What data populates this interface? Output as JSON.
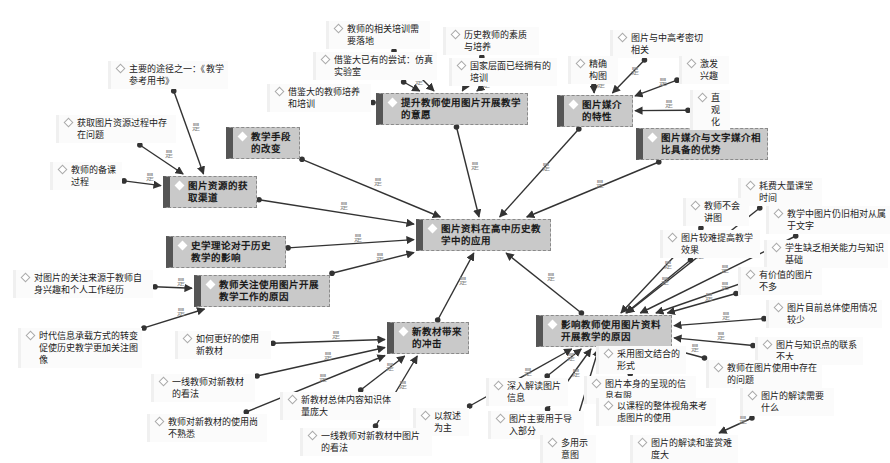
{
  "diagram": {
    "center": {
      "id": "c",
      "text": "图片资料在高中历史教学中的应用",
      "x": 416,
      "y": 219,
      "w": 135
    },
    "main_nodes": [
      {
        "id": "m1",
        "text": "提升教师使用图片开展教学的意愿",
        "x": 376,
        "y": 93,
        "w": 152
      },
      {
        "id": "m2",
        "text": "图片媒介的特性",
        "x": 557,
        "y": 95,
        "w": 76
      },
      {
        "id": "m3",
        "text": "图片媒介与文字媒介相比具备的优势",
        "x": 636,
        "y": 128,
        "w": 132
      },
      {
        "id": "m4",
        "text": "教学手段的改变",
        "x": 226,
        "y": 127,
        "w": 74
      },
      {
        "id": "m5",
        "text": "图片资源的获取渠道",
        "x": 163,
        "y": 176,
        "w": 94
      },
      {
        "id": "m6",
        "text": "史学理论对于历史教学的影响",
        "x": 166,
        "y": 236,
        "w": 120
      },
      {
        "id": "m7",
        "text": "教师关注使用图片开展教学工作的原因",
        "x": 194,
        "y": 275,
        "w": 136
      },
      {
        "id": "m8",
        "text": "新教材带来的冲击",
        "x": 387,
        "y": 322,
        "w": 82
      },
      {
        "id": "m9",
        "text": "影响教师使用图片资料开展教学的原因",
        "x": 536,
        "y": 315,
        "w": 136
      }
    ],
    "leaf_nodes": [
      {
        "id": "l1",
        "text": "主要的途径之一：《教学参考用书》",
        "x": 108,
        "y": 61,
        "w": 120
      },
      {
        "id": "l2",
        "text": "获取图片资源过程中存在问题",
        "x": 56,
        "y": 115,
        "w": 120
      },
      {
        "id": "l3",
        "text": "教师的备课过程",
        "x": 50,
        "y": 162,
        "w": 72
      },
      {
        "id": "l4",
        "text": "教师的相关培训需要落地",
        "x": 326,
        "y": 21,
        "w": 104
      },
      {
        "id": "l5",
        "text": "历史教师的素质与培养",
        "x": 443,
        "y": 27,
        "w": 96
      },
      {
        "id": "l6",
        "text": "借鉴大已有的尝试：仿真实验室",
        "x": 313,
        "y": 52,
        "w": 124
      },
      {
        "id": "l7",
        "text": "国家层面已经拥有的培训",
        "x": 449,
        "y": 58,
        "w": 108
      },
      {
        "id": "l8",
        "text": "借鉴大的教师培养和培训",
        "x": 267,
        "y": 84,
        "w": 104
      },
      {
        "id": "l9",
        "text": "图片与中高考密切相关",
        "x": 610,
        "y": 30,
        "w": 100
      },
      {
        "id": "l10",
        "text": "精确构图",
        "x": 568,
        "y": 56,
        "w": 50
      },
      {
        "id": "l11",
        "text": "激发兴趣",
        "x": 679,
        "y": 56,
        "w": 50
      },
      {
        "id": "l12",
        "text": "直观化",
        "x": 690,
        "y": 90,
        "w": 40
      },
      {
        "id": "l13",
        "text": "耗费大量课堂时间",
        "x": 738,
        "y": 178,
        "w": 84
      },
      {
        "id": "l14",
        "text": "教师不会讲图",
        "x": 683,
        "y": 198,
        "w": 66
      },
      {
        "id": "l15",
        "text": "教学中图片仍旧相对从属于文字",
        "x": 766,
        "y": 206,
        "w": 124
      },
      {
        "id": "l16",
        "text": "图片较难提高教学效果",
        "x": 660,
        "y": 230,
        "w": 100
      },
      {
        "id": "l17",
        "text": "学生缺乏相关能力与知识基础",
        "x": 764,
        "y": 240,
        "w": 124
      },
      {
        "id": "l18",
        "text": "有价值的图片不多",
        "x": 738,
        "y": 267,
        "w": 84
      },
      {
        "id": "l19",
        "text": "图片目前总体使用情况较少",
        "x": 766,
        "y": 300,
        "w": 116
      },
      {
        "id": "l20",
        "text": "图片与知识点的联系不大",
        "x": 755,
        "y": 337,
        "w": 108
      },
      {
        "id": "l21",
        "text": "教师在图片使用中存在的问题",
        "x": 706,
        "y": 360,
        "w": 116
      },
      {
        "id": "l22",
        "text": "图片的解读需要什么",
        "x": 740,
        "y": 388,
        "w": 94
      },
      {
        "id": "l23",
        "text": "图片的解读和鉴赏难度大",
        "x": 630,
        "y": 435,
        "w": 108
      },
      {
        "id": "l24",
        "text": "采用图文结合的形式",
        "x": 596,
        "y": 346,
        "w": 90
      },
      {
        "id": "l25",
        "text": "图片本身的呈现的信息有限",
        "x": 584,
        "y": 376,
        "w": 112
      },
      {
        "id": "l26",
        "text": "以课程的整体视角来考虑图片的使用",
        "x": 596,
        "y": 398,
        "w": 120
      },
      {
        "id": "l27",
        "text": "深入解读图片信息",
        "x": 486,
        "y": 378,
        "w": 82
      },
      {
        "id": "l28",
        "text": "图片主要用于导入部分",
        "x": 488,
        "y": 411,
        "w": 96
      },
      {
        "id": "l29",
        "text": "多用示意图",
        "x": 540,
        "y": 435,
        "w": 56
      },
      {
        "id": "l30",
        "text": "以叙述为主",
        "x": 413,
        "y": 408,
        "w": 56
      },
      {
        "id": "l31",
        "text": "如何更好的使用新教材",
        "x": 175,
        "y": 331,
        "w": 96
      },
      {
        "id": "l32",
        "text": "一线教师对新教材的看法",
        "x": 151,
        "y": 374,
        "w": 104
      },
      {
        "id": "l33",
        "text": "新教材总体内容知识体量庞大",
        "x": 280,
        "y": 392,
        "w": 120
      },
      {
        "id": "l34",
        "text": "教师对新教材的使用尚不熟悉",
        "x": 147,
        "y": 414,
        "w": 120
      },
      {
        "id": "l35",
        "text": "一线教师对新教材中图片的看法",
        "x": 300,
        "y": 428,
        "w": 132
      },
      {
        "id": "l36",
        "text": "对图片的关注来源于教师自身兴趣和个人工作经历",
        "x": 13,
        "y": 270,
        "w": 140
      },
      {
        "id": "l37",
        "text": "时代信息承载方式的转变促使历史教学更加关注图像",
        "x": 18,
        "y": 328,
        "w": 124
      }
    ],
    "edge_label": "是",
    "edges": [
      [
        "m1",
        "c"
      ],
      [
        "m2",
        "c"
      ],
      [
        "m3",
        "c"
      ],
      [
        "m4",
        "c"
      ],
      [
        "m5",
        "c"
      ],
      [
        "m6",
        "c"
      ],
      [
        "m7",
        "c"
      ],
      [
        "m8",
        "c"
      ],
      [
        "m9",
        "c"
      ],
      [
        "l1",
        "m5"
      ],
      [
        "l2",
        "m5"
      ],
      [
        "l3",
        "m5"
      ],
      [
        "l4",
        "m1"
      ],
      [
        "l5",
        "m1"
      ],
      [
        "l6",
        "m1"
      ],
      [
        "l7",
        "m1"
      ],
      [
        "l8",
        "m1"
      ],
      [
        "l9",
        "m2"
      ],
      [
        "l10",
        "m2"
      ],
      [
        "l11",
        "m2"
      ],
      [
        "l12",
        "m2"
      ],
      [
        "l13",
        "m9"
      ],
      [
        "l14",
        "m9"
      ],
      [
        "l15",
        "m9"
      ],
      [
        "l16",
        "m9"
      ],
      [
        "l17",
        "m9"
      ],
      [
        "l18",
        "m9"
      ],
      [
        "l19",
        "m9"
      ],
      [
        "l20",
        "m9"
      ],
      [
        "l21",
        "m9"
      ],
      [
        "l22",
        "l23"
      ],
      [
        "l24",
        "m9"
      ],
      [
        "l25",
        "m9"
      ],
      [
        "l27",
        "m9"
      ],
      [
        "l28",
        "m9"
      ],
      [
        "l29",
        "m9"
      ],
      [
        "l30",
        "m9"
      ],
      [
        "l31",
        "m8"
      ],
      [
        "l32",
        "m8"
      ],
      [
        "l33",
        "m8"
      ],
      [
        "l34",
        "m8"
      ],
      [
        "l35",
        "m8"
      ],
      [
        "l36",
        "m7"
      ],
      [
        "l37",
        "m7"
      ]
    ],
    "colors": {
      "main_fill": "#c9c9c9",
      "main_bar": "#555555",
      "leaf_fill": "#fbfbfb",
      "edge": "#333333"
    }
  }
}
